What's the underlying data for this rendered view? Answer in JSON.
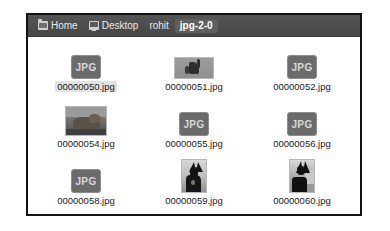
{
  "window": {
    "title": "jpg-2-0"
  },
  "pathbar": {
    "crumbs": [
      {
        "label": "Home",
        "icon": "folder-icon",
        "active": false
      },
      {
        "label": "Desktop",
        "icon": "monitor-icon",
        "active": false
      },
      {
        "label": "rohit",
        "icon": "none",
        "active": false
      },
      {
        "label": "jpg-2-0",
        "icon": "none",
        "active": true
      }
    ]
  },
  "icon_view": {
    "files": [
      {
        "name": "00000050.jpg",
        "thumb": "jpg-placeholder",
        "selected": true
      },
      {
        "name": "00000051.jpg",
        "thumb": "photo-51",
        "selected": false
      },
      {
        "name": "00000052.jpg",
        "thumb": "jpg-placeholder",
        "selected": false
      },
      {
        "name": "00000054.jpg",
        "thumb": "photo-54",
        "selected": false
      },
      {
        "name": "00000055.jpg",
        "thumb": "jpg-placeholder",
        "selected": false
      },
      {
        "name": "00000056.jpg",
        "thumb": "jpg-placeholder",
        "selected": false
      },
      {
        "name": "00000058.jpg",
        "thumb": "jpg-placeholder",
        "selected": false
      },
      {
        "name": "00000059.jpg",
        "thumb": "photo-59",
        "selected": false
      },
      {
        "name": "00000060.jpg",
        "thumb": "photo-60",
        "selected": false
      }
    ],
    "placeholder_label": "JPG"
  },
  "colors": {
    "pathbar_bg": "#4d4d4d",
    "pathbar_text": "#e9e9e9",
    "active_crumb_bg": "#5f5f5f",
    "window_border": "#121212",
    "view_bg": "#ffffff",
    "jpg_icon_bg": "#6b6b6b",
    "selection_bg": "#e2e2e2"
  }
}
